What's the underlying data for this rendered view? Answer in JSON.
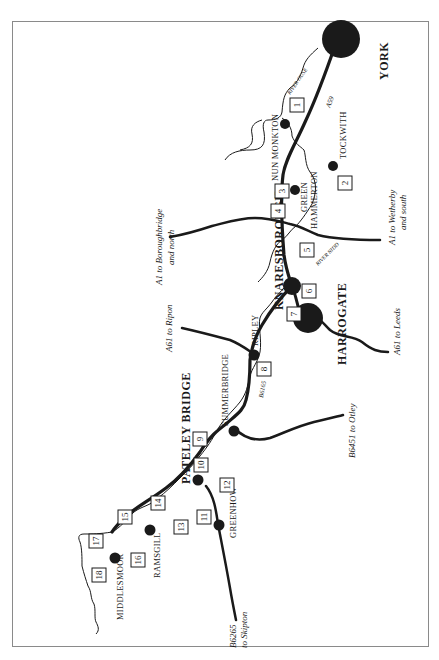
{
  "map": {
    "orientation": "rotated 90deg counter-clockwise (north to the left)",
    "colors": {
      "ink": "#1a1a1a",
      "frame": "#8a8a8a",
      "background": "#ffffff"
    },
    "major_towns": [
      {
        "id": "york",
        "label": "YORK"
      },
      {
        "id": "harrogate",
        "label": "HARROGATE"
      },
      {
        "id": "knaresborough",
        "label": "KNARESBOROUGH"
      },
      {
        "id": "pateley-bridge",
        "label": "PATELEY BRIDGE"
      }
    ],
    "villages": [
      {
        "id": "nun-monkton",
        "label": "NUN MONKTON"
      },
      {
        "id": "tockwith",
        "label": "TOCKWITH"
      },
      {
        "id": "green-hammerton",
        "label_line1": "GREEN",
        "label_line2": "HAMMERTON"
      },
      {
        "id": "ripley",
        "label": "RIPLEY"
      },
      {
        "id": "summerbridge",
        "label": "SUMMERBRIDGE"
      },
      {
        "id": "greenhow",
        "label": "GREENHOW"
      },
      {
        "id": "ramsgill",
        "label": "RAMSGILL"
      },
      {
        "id": "middlesmoor",
        "label": "MIDDLESMOOR"
      }
    ],
    "roads": [
      {
        "id": "a59",
        "label": "A59"
      },
      {
        "id": "b6165",
        "label": "B6165"
      },
      {
        "id": "a1-north",
        "label_line1": "A1  to Boroughbridge",
        "label_line2": "and north"
      },
      {
        "id": "a1-south",
        "label_line1": "A1  to Wetherby",
        "label_line2": "and south"
      },
      {
        "id": "a61-ripon",
        "label": "A61  to Ripon"
      },
      {
        "id": "a61-leeds",
        "label": "A61  to Leeds"
      },
      {
        "id": "b6451",
        "label": "B6451  to Otley"
      },
      {
        "id": "b6265",
        "label_line1": "B6265",
        "label_line2": "to Skipton"
      }
    ],
    "rivers": [
      {
        "id": "ouse",
        "label": "RIVER OUSE"
      },
      {
        "id": "nidd",
        "label": "RIVER NIDD"
      }
    ],
    "waypoints": [
      "1",
      "2",
      "3",
      "4",
      "5",
      "6",
      "7",
      "8",
      "9",
      "10",
      "11",
      "12",
      "13",
      "14",
      "15",
      "16",
      "17",
      "18"
    ]
  }
}
